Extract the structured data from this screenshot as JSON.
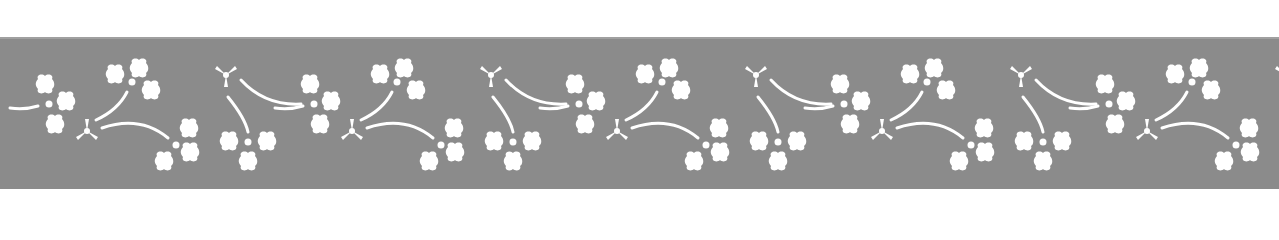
{
  "image": {
    "description": "Decorative stencil border band with white floral and tripod motifs on gray background",
    "background_color": "#ffffff",
    "band_color": "#8b8b8b",
    "motif_color": "#ffffff"
  },
  "pattern": {
    "repeat_period_px": 265,
    "repeat_count": 5,
    "motifs": [
      "four-petal-flower",
      "tripod-sprig",
      "curved-stem"
    ]
  }
}
